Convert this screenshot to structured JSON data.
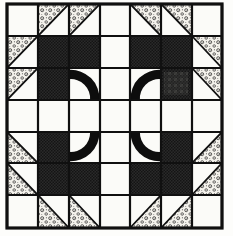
{
  "figure": {
    "kind": "quilt-block-diagram",
    "symmetry": "4-fold rotational",
    "canvas": {
      "width": 233,
      "height": 236
    }
  },
  "grid": {
    "rows": 7,
    "cols": 7,
    "x": [
      7,
      38,
      69,
      100,
      130,
      161,
      192,
      222
    ],
    "y": [
      4,
      36,
      68,
      100,
      132,
      163,
      195,
      228
    ],
    "line_color": "#101010",
    "line_width": 2.2,
    "border_width": 3.2
  },
  "fabrics": [
    {
      "key": "background",
      "label": "Background (plain white)",
      "color": "#fbfbf8"
    },
    {
      "key": "dark",
      "label": "Dark solid (checkered halftone)",
      "color": "#2a2a2a"
    },
    {
      "key": "floral",
      "label": "Floral print (dotted light)",
      "color": "#f2f0e9"
    },
    {
      "key": "arc",
      "label": "Arc applique (black)",
      "color": "#0d0d0d"
    }
  ],
  "cells": [
    [
      {
        "fill": "background"
      },
      {
        "fill": "hst",
        "fabric": "floral",
        "corner": "tl"
      },
      {
        "fill": "hst",
        "fabric": "floral",
        "corner": "tl"
      },
      {
        "fill": "background"
      },
      {
        "fill": "hst",
        "fabric": "floral",
        "corner": "tr"
      },
      {
        "fill": "hst",
        "fabric": "floral",
        "corner": "tr"
      },
      {
        "fill": "background"
      }
    ],
    [
      {
        "fill": "hst",
        "fabric": "floral",
        "corner": "tl"
      },
      {
        "fill": "dark"
      },
      {
        "fill": "dark"
      },
      {
        "fill": "background"
      },
      {
        "fill": "dark"
      },
      {
        "fill": "dark"
      },
      {
        "fill": "hst",
        "fabric": "floral",
        "corner": "tr"
      }
    ],
    [
      {
        "fill": "hst",
        "fabric": "floral",
        "corner": "tl"
      },
      {
        "fill": "dark"
      },
      {
        "fill": "arc",
        "arc": "tl"
      },
      {
        "fill": "background"
      },
      {
        "fill": "arc",
        "arc": "tr"
      },
      {
        "fill": "dark",
        "smudge": true
      },
      {
        "fill": "hst",
        "fabric": "floral",
        "corner": "tr"
      }
    ],
    [
      {
        "fill": "background"
      },
      {
        "fill": "background"
      },
      {
        "fill": "background"
      },
      {
        "fill": "background"
      },
      {
        "fill": "background"
      },
      {
        "fill": "background"
      },
      {
        "fill": "background"
      }
    ],
    [
      {
        "fill": "hst",
        "fabric": "floral",
        "corner": "bl"
      },
      {
        "fill": "dark"
      },
      {
        "fill": "arc",
        "arc": "bl"
      },
      {
        "fill": "background"
      },
      {
        "fill": "arc",
        "arc": "br"
      },
      {
        "fill": "dark"
      },
      {
        "fill": "hst",
        "fabric": "floral",
        "corner": "br"
      }
    ],
    [
      {
        "fill": "hst",
        "fabric": "floral",
        "corner": "bl"
      },
      {
        "fill": "dark"
      },
      {
        "fill": "dark"
      },
      {
        "fill": "background"
      },
      {
        "fill": "dark"
      },
      {
        "fill": "dark"
      },
      {
        "fill": "hst",
        "fabric": "floral",
        "corner": "br"
      }
    ],
    [
      {
        "fill": "background"
      },
      {
        "fill": "hst",
        "fabric": "floral",
        "corner": "bl"
      },
      {
        "fill": "hst",
        "fabric": "floral",
        "corner": "bl"
      },
      {
        "fill": "background"
      },
      {
        "fill": "hst",
        "fabric": "floral",
        "corner": "br"
      },
      {
        "fill": "hst",
        "fabric": "floral",
        "corner": "br"
      },
      {
        "fill": "background"
      }
    ]
  ]
}
